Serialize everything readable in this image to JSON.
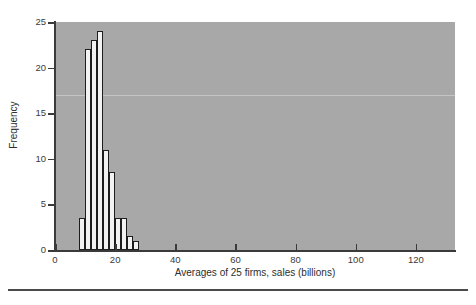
{
  "chart_data": {
    "type": "bar",
    "title": "",
    "subtitle": "",
    "xlabel": "Averages of 25 firms, sales (billions)",
    "ylabel": "Frequency",
    "xlim": [
      0,
      133
    ],
    "ylim": [
      0,
      25
    ],
    "xticks": [
      0,
      20,
      40,
      60,
      80,
      100,
      120
    ],
    "yticks": [
      0,
      5,
      10,
      15,
      20,
      25
    ],
    "grid": false,
    "legend": null,
    "bin_width": 2,
    "bin_starts": [
      8,
      10,
      12,
      14,
      16,
      18,
      20,
      22,
      24,
      26,
      28
    ],
    "categories": [
      "8-10",
      "10-12",
      "12-14",
      "14-16",
      "16-18",
      "18-20",
      "20-22",
      "22-24",
      "24-26",
      "26-28",
      "28-30"
    ],
    "values": [
      3.5,
      22,
      23,
      24,
      11,
      8.5,
      3.5,
      3.5,
      1.5,
      1,
      0
    ],
    "bars": [
      {
        "x0": 8,
        "x1": 10,
        "height": 3.5
      },
      {
        "x0": 10,
        "x1": 12,
        "height": 22
      },
      {
        "x0": 12,
        "x1": 14,
        "height": 23
      },
      {
        "x0": 14,
        "x1": 16,
        "height": 24
      },
      {
        "x0": 16,
        "x1": 18,
        "height": 11
      },
      {
        "x0": 18,
        "x1": 20,
        "height": 8.5
      },
      {
        "x0": 20,
        "x1": 22,
        "height": 3.5
      },
      {
        "x0": 22,
        "x1": 24,
        "height": 3.5
      },
      {
        "x0": 24,
        "x1": 26,
        "height": 1.5
      },
      {
        "x0": 26,
        "x1": 28,
        "height": 1
      }
    ],
    "colors": {
      "panel_background": "#a8a8a8",
      "bar_fill": "#f2f2f2",
      "bar_edge": "#1d1d1d",
      "axis": "#3a3a3a",
      "text": "#2e2e2e",
      "figure_background": "#ffffff"
    }
  }
}
